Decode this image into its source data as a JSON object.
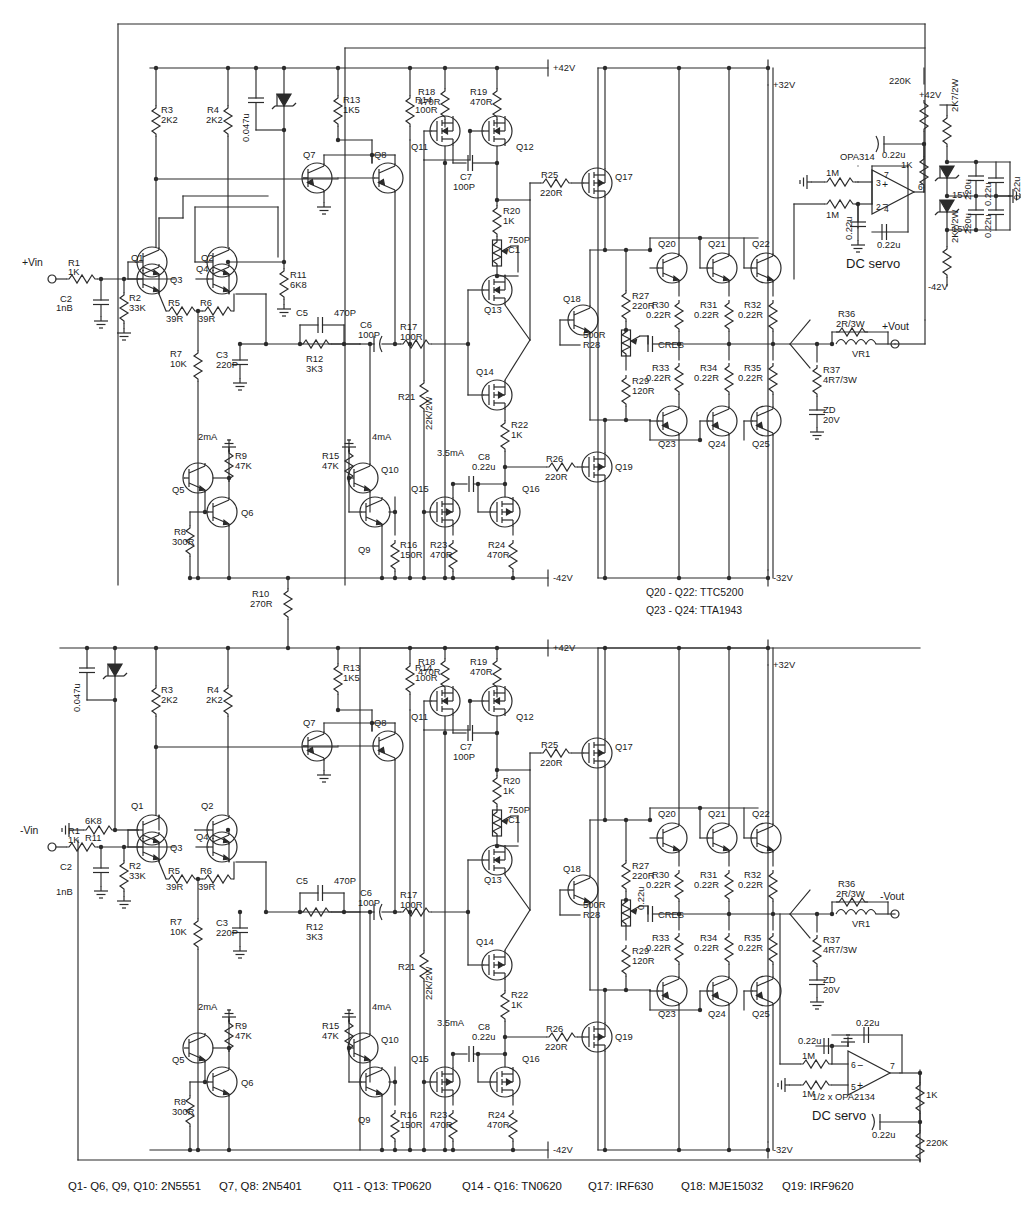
{
  "sheet": {
    "title": "Balanced bridged power amplifier schematic",
    "width": 1033,
    "height": 1220,
    "background": "#ffffff",
    "ink": "#2b2b2b"
  },
  "footer": {
    "notes": [
      "Q1- Q6, Q9, Q10: 2N5551",
      "Q7, Q8: 2N5401",
      "Q11 - Q13: TP0620",
      "Q14 - Q16: TN0620",
      "Q17: IRF630",
      "Q18: MJE15032",
      "Q19: IRF9620"
    ]
  },
  "output_stage_notes": [
    "Q20 - Q22: TTC5200",
    "Q23 - Q24: TTA1943"
  ],
  "rails": {
    "pos42": "+42V",
    "neg42": "-42V",
    "pos32": "+32V",
    "neg32": "-32V"
  },
  "ports": {
    "vin_pos": "+Vin",
    "vin_neg": "-Vin",
    "vout_pos": "+Vout",
    "vout_neg": "-Vout"
  },
  "servo_top": {
    "name": "DC servo",
    "opamp": "OPA314",
    "pins": {
      "p3": "3",
      "p2": "2",
      "p7": "7",
      "p6": "6",
      "p4": "4"
    },
    "r_in_a": "1M",
    "r_in_b": "1M",
    "c_in": "0.22u",
    "c_fb": "0.22u",
    "r_out_top": "220K",
    "c_out": "0.22u",
    "r_out_bot": "1K",
    "supply": {
      "rail_pos": "+42V",
      "rail_neg": "-42V",
      "r_drop_pos": "2K7/2W",
      "r_drop_neg": "2K7/2W",
      "zener_pos": "15V",
      "zener_neg": "15V",
      "c_pos": "220u",
      "c_neg": "220u",
      "c_pos2": "0.22u",
      "c_neg2": "0.22u",
      "c_pos3": "0.22u",
      "c_neg3": "0.22u"
    }
  },
  "servo_bottom": {
    "name": "DC servo",
    "opamp": "1/2 x OPA2134",
    "pins": {
      "p5": "5",
      "p6": "6",
      "p7": "7"
    },
    "r_in_a": "1M",
    "r_in_b": "1M",
    "c_in": "0.22u",
    "c_fb": "0.22u",
    "r_out_top": "1K",
    "c_out": "0.22u",
    "r_out_bot": "220K"
  },
  "channel": {
    "currents": {
      "i1": "2mA",
      "i2": "4mA",
      "i3": "3.5mA"
    },
    "transistors": [
      "Q1",
      "Q2",
      "Q3",
      "Q4",
      "Q5",
      "Q6",
      "Q7",
      "Q8",
      "Q9",
      "Q10",
      "Q11",
      "Q12",
      "Q13",
      "Q14",
      "Q15",
      "Q16",
      "Q17",
      "Q18",
      "Q19",
      "Q20",
      "Q21",
      "Q22",
      "Q23",
      "Q24",
      "Q25"
    ],
    "components": [
      {
        "ref": "R1",
        "val": "1K"
      },
      {
        "ref": "R2",
        "val": "33K"
      },
      {
        "ref": "R3",
        "val": "2K2"
      },
      {
        "ref": "R4",
        "val": "2K2"
      },
      {
        "ref": "R5",
        "val": "39R"
      },
      {
        "ref": "R6",
        "val": "39R"
      },
      {
        "ref": "R7",
        "val": "10K"
      },
      {
        "ref": "R8",
        "val": "300R"
      },
      {
        "ref": "R9",
        "val": "47K"
      },
      {
        "ref": "R10",
        "val": "270R"
      },
      {
        "ref": "R11",
        "val": "6K8"
      },
      {
        "ref": "R12",
        "val": "3K3"
      },
      {
        "ref": "R13",
        "val": "1K5"
      },
      {
        "ref": "R14",
        "val": "100R"
      },
      {
        "ref": "R15",
        "val": "47K"
      },
      {
        "ref": "R16",
        "val": "150R"
      },
      {
        "ref": "R17",
        "val": "100R"
      },
      {
        "ref": "R18",
        "val": "470R"
      },
      {
        "ref": "R19",
        "val": "470R"
      },
      {
        "ref": "R20",
        "val": "1K"
      },
      {
        "ref": "R21",
        "val": "22K/2W"
      },
      {
        "ref": "R22",
        "val": "1K"
      },
      {
        "ref": "R23",
        "val": "470R"
      },
      {
        "ref": "R24",
        "val": "470R"
      },
      {
        "ref": "R25",
        "val": "220R"
      },
      {
        "ref": "R26",
        "val": "220R"
      },
      {
        "ref": "R27",
        "val": "220R"
      },
      {
        "ref": "R28",
        "val": "500R"
      },
      {
        "ref": "R29",
        "val": "120R"
      },
      {
        "ref": "R30",
        "val": "0.22R"
      },
      {
        "ref": "R31",
        "val": "0.22R"
      },
      {
        "ref": "R32",
        "val": "0.22R"
      },
      {
        "ref": "R33",
        "val": "0.22R"
      },
      {
        "ref": "R34",
        "val": "0.22R"
      },
      {
        "ref": "R35",
        "val": "0.22R"
      },
      {
        "ref": "R36",
        "val": "2R/3W"
      },
      {
        "ref": "R37",
        "val": "4R7/3W"
      },
      {
        "ref": "VR1",
        "val": "500R"
      },
      {
        "ref": "C1",
        "val": "750P"
      },
      {
        "ref": "C2",
        "val": "1nB"
      },
      {
        "ref": "C3",
        "val": "220P"
      },
      {
        "ref": "C5",
        "val": "470P"
      },
      {
        "ref": "C6",
        "val": "100P"
      },
      {
        "ref": "C7",
        "val": "100P"
      },
      {
        "ref": "C8",
        "val": "0.22u"
      },
      {
        "ref": "C9",
        "val": "0.047u"
      },
      {
        "ref": "L1",
        "val": ""
      },
      {
        "ref": "CRES",
        "val": "100u/50V"
      },
      {
        "ref": "ZD",
        "val": "20V"
      }
    ]
  }
}
